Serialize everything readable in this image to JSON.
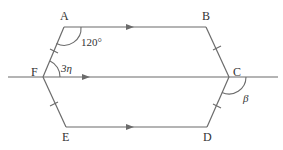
{
  "diagram": {
    "type": "geometry-hexagon",
    "colors": {
      "line": "#6b6b6b",
      "text": "#333333",
      "background": "#ffffff"
    },
    "vertices": [
      {
        "id": "A",
        "label": "A",
        "x": 64,
        "y": 27
      },
      {
        "id": "B",
        "label": "B",
        "x": 206,
        "y": 27
      },
      {
        "id": "C",
        "label": "C",
        "x": 229,
        "y": 77
      },
      {
        "id": "D",
        "label": "D",
        "x": 207,
        "y": 127
      },
      {
        "id": "E",
        "label": "E",
        "x": 66,
        "y": 127
      },
      {
        "id": "F",
        "label": "F",
        "x": 43,
        "y": 77
      }
    ],
    "angles": {
      "angle_A": "120°",
      "angle_F": "3η",
      "angle_C": "β"
    },
    "parallel_marks": [
      "AB",
      "FC",
      "ED"
    ],
    "equal_side_marks": [
      "AF",
      "BC",
      "CD",
      "EF"
    ],
    "transversal": "line through F and C, extended both directions"
  }
}
